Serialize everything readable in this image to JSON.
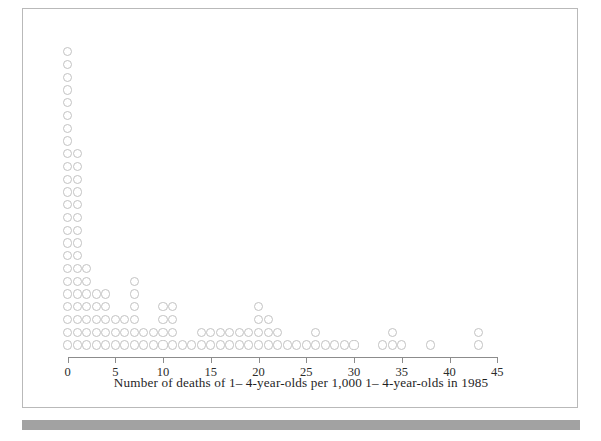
{
  "figure": {
    "background_color": "#ffffff",
    "frame_color": "#b9b9b9",
    "bottom_bar_color": "#9a9a9a",
    "dot_color": "#c2c2c2",
    "axis_color": "#8c8c8c"
  },
  "axis": {
    "caption": "Number of deaths of 1– 4-year-olds per 1,000 1– 4-year-olds in 1985",
    "tick_labels": [
      "0",
      "5",
      "10",
      "15",
      "20",
      "25",
      "30",
      "35",
      "40",
      "45"
    ],
    "tick_values": [
      0,
      5,
      10,
      15,
      20,
      25,
      30,
      35,
      40,
      45
    ]
  },
  "chart_data": {
    "type": "scatter",
    "plot_style": "dot-plot",
    "title": "",
    "subtitle": "",
    "xlabel": "Number of deaths of 1– 4-year-olds per 1,000 1– 4-year-olds in 1985",
    "ylabel": "",
    "xlim": [
      0,
      45
    ],
    "ylim": [
      0,
      25
    ],
    "grid": false,
    "legend": "none",
    "x": [
      0,
      1,
      2,
      3,
      4,
      5,
      6,
      7,
      8,
      9,
      10,
      11,
      12,
      13,
      14,
      15,
      16,
      17,
      18,
      19,
      20,
      21,
      22,
      23,
      24,
      25,
      26,
      27,
      28,
      29,
      30,
      31,
      32,
      33,
      34,
      35,
      36,
      37,
      38,
      39,
      40,
      41,
      42,
      43
    ],
    "counts": [
      24,
      16,
      7,
      5,
      5,
      3,
      3,
      6,
      2,
      2,
      4,
      4,
      1,
      1,
      2,
      2,
      2,
      2,
      2,
      2,
      4,
      3,
      2,
      1,
      1,
      1,
      2,
      1,
      1,
      1,
      1,
      0,
      0,
      1,
      2,
      1,
      0,
      0,
      1,
      0,
      0,
      0,
      0,
      2
    ],
    "categories": [
      "0",
      "1",
      "2",
      "3",
      "4",
      "5",
      "6",
      "7",
      "8",
      "9",
      "10",
      "11",
      "12",
      "13",
      "14",
      "15",
      "16",
      "17",
      "18",
      "19",
      "20",
      "21",
      "22",
      "23",
      "24",
      "25",
      "26",
      "27",
      "28",
      "29",
      "30",
      "31",
      "32",
      "33",
      "34",
      "35",
      "36",
      "37",
      "38",
      "39",
      "40",
      "41",
      "42",
      "43"
    ],
    "values": [
      24,
      16,
      7,
      5,
      5,
      3,
      3,
      6,
      2,
      2,
      4,
      4,
      1,
      1,
      2,
      2,
      2,
      2,
      2,
      2,
      4,
      3,
      2,
      1,
      1,
      1,
      2,
      1,
      1,
      1,
      1,
      0,
      0,
      1,
      2,
      1,
      0,
      0,
      1,
      0,
      0,
      0,
      0,
      2
    ],
    "total_observations": 130
  }
}
